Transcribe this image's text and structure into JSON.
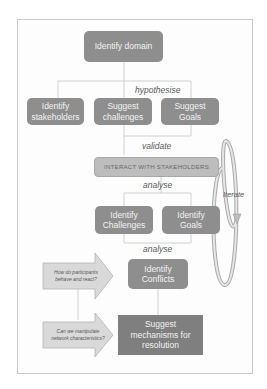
{
  "diagram": {
    "nodes": {
      "identify_domain": "Identify domain",
      "identify_stakeholders": "Identify\nstakeholders",
      "suggest_challenges": "Suggest\nchallenges",
      "suggest_goals": "Suggest\nGoals",
      "interact_with_stakeholders": "Interact with Stakeholders",
      "identify_challenges": "Identify\nChallenges",
      "identify_goals": "Identify\nGoals",
      "identify_conflicts": "Identify\nConflicts",
      "suggest_mechanisms": "Suggest\nmechanisms for\nresolution"
    },
    "edge_labels": {
      "hypothesise": "hypothesise",
      "validate": "validate",
      "analyse_1": "analyse",
      "analyse_2": "analyse",
      "iterate": "Iterate"
    },
    "questions": {
      "behaviour": "How do participants\nbehave and react?",
      "network": "Can we manipulate\nnetwork characteristics?"
    },
    "colors": {
      "dark_box": "#8e8e8e",
      "light_box": "#bdbdbd",
      "arrow_fill": "#d9d9d9",
      "line": "#bfbfbf"
    }
  }
}
